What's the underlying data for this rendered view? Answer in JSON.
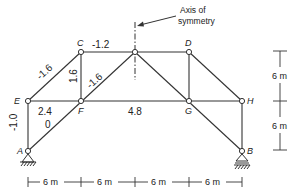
{
  "annotation": {
    "line1": "Axis of",
    "line2": "symmetry"
  },
  "nodes": [
    {
      "id": "A",
      "label": "A",
      "x": 28,
      "y": 151
    },
    {
      "id": "B",
      "label": "B",
      "x": 242,
      "y": 151
    },
    {
      "id": "C",
      "label": "C",
      "x": 81,
      "y": 52
    },
    {
      "id": "D",
      "label": "D",
      "x": 189,
      "y": 52
    },
    {
      "id": "E",
      "label": "E",
      "x": 28,
      "y": 101
    },
    {
      "id": "F",
      "label": "F",
      "x": 81,
      "y": 101
    },
    {
      "id": "G",
      "label": "G",
      "x": 189,
      "y": 101
    },
    {
      "id": "H",
      "label": "H",
      "x": 242,
      "y": 101
    },
    {
      "id": "T",
      "label": "",
      "x": 135,
      "y": 52
    }
  ],
  "member_forces": {
    "CT": "-1.2",
    "EC": "-1.6",
    "CF": "1.6",
    "FT": "-1.6",
    "EF": "2.4",
    "AF": "0",
    "FG": "4.8",
    "AE": "-1.0"
  },
  "dimensions": {
    "horizontal": [
      "6 m",
      "6 m",
      "6 m",
      "6 m"
    ],
    "vertical": [
      "6 m",
      "6 m"
    ]
  }
}
